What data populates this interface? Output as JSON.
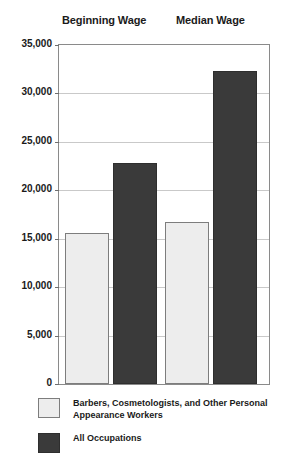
{
  "chart_data": {
    "type": "bar",
    "title": "",
    "subtitle": "",
    "xlabel": "",
    "ylabel": "",
    "categories": [
      "Beginning Wage",
      "Median Wage"
    ],
    "series": [
      {
        "name": "Barbers, Cosmetologists, and Other Personal Appearance Workers",
        "color": "#ededed",
        "values": [
          15600,
          16700
        ]
      },
      {
        "name": "All Occupations",
        "color": "#3a3a3a",
        "values": [
          22800,
          32300
        ]
      }
    ],
    "ylim": [
      0,
      35000
    ],
    "ytick_values": [
      35000,
      30000,
      25000,
      20000,
      15000,
      10000,
      5000,
      0
    ],
    "ytick_labels": [
      "35,000",
      "30,000",
      "25,000",
      "20,000",
      "15,000",
      "10,000",
      "5,000",
      "0"
    ],
    "grid": true,
    "grid_axis": "y",
    "legend_position": "bottom-left",
    "axis_line_color": "#8a8a8a",
    "grid_color": "#c9c9c9"
  },
  "headers": [
    {
      "label": "Beginning Wage"
    },
    {
      "label": "Median Wage"
    }
  ],
  "legend": {
    "items": [
      {
        "label": "Barbers, Cosmetologists, and Other Personal Appearance Workers",
        "swatch": "light"
      },
      {
        "label": "All Occupations",
        "swatch": "dark"
      }
    ]
  }
}
